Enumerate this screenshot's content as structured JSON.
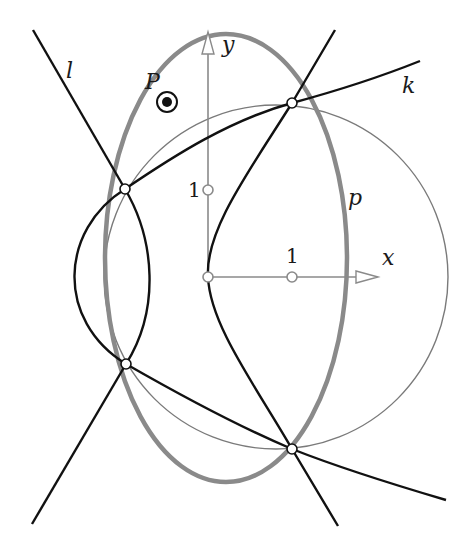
{
  "figure": {
    "labels": {
      "l": "l",
      "k": "k",
      "p": "p",
      "P": "P",
      "x_axis": "x",
      "y_axis": "y",
      "x_unit": "1",
      "y_unit": "1"
    },
    "colors": {
      "black_curve": "#111111",
      "ellipse_p": "#8a8a8a",
      "thin_circle": "#7a7a7a",
      "axes": "#8a8a8a"
    },
    "elements": [
      "line l",
      "line through upper-right and lower-left intersection points",
      "curve k",
      "hyperbola branches",
      "thick gray ellipse p",
      "thin gray circle",
      "x and y axes with unit marks",
      "point P",
      "four intersection points"
    ]
  }
}
